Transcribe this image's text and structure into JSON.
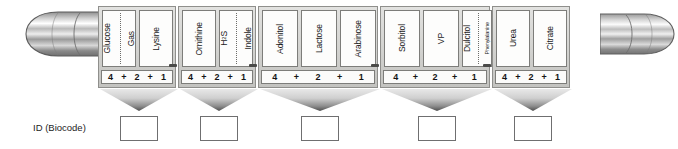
{
  "diagram": {
    "caption": "ID (Biocode)",
    "end_caps": {
      "left": "metallic-capsule-end",
      "right": "metallic-capsule-end"
    },
    "colors": {
      "tray_body": "#d2d2cf",
      "tray_border": "#8f8f8c",
      "cell_fill": "#fdfdfc",
      "cell_border": "#7d7d7a",
      "funnel_dark": "#4f4f4f",
      "funnel_light": "#e8e8e8",
      "text": "#1b1b1b",
      "result_box_border": "#6f6f70"
    },
    "groups": [
      {
        "id": "group-1",
        "left": 0,
        "width": 78,
        "score": [
          "4",
          "+",
          "2",
          "+",
          "1"
        ],
        "cells": [
          {
            "width": 34,
            "labels": [
              "Glucose",
              "Gas"
            ],
            "split": true,
            "divider_pct": 52
          },
          {
            "width": 34,
            "labels": [
              "Lysine"
            ],
            "split": false
          }
        ]
      },
      {
        "id": "group-2",
        "left": 80,
        "width": 78,
        "score": [
          "4",
          "+",
          "2",
          "+",
          "1"
        ],
        "cells": [
          {
            "width": 34,
            "labels": [
              "Ornithine"
            ],
            "split": false
          },
          {
            "width": 34,
            "labels": [
              "H2S",
              "Indole"
            ],
            "split": true,
            "divider_pct": 50
          }
        ]
      },
      {
        "id": "group-3",
        "left": 160,
        "width": 120,
        "score": [
          "4",
          "+",
          "2",
          "+",
          "1"
        ],
        "cells": [
          {
            "width": 36,
            "labels": [
              "Adonitol"
            ],
            "split": false
          },
          {
            "width": 36,
            "labels": [
              "Lactose"
            ],
            "split": false
          },
          {
            "width": 36,
            "labels": [
              "Arabinose"
            ],
            "split": false
          }
        ]
      },
      {
        "id": "group-4",
        "left": 282,
        "width": 110,
        "score": [
          "4",
          "+",
          "2",
          "+",
          "1"
        ],
        "cells": [
          {
            "width": 36,
            "labels": [
              "Sorbitol"
            ],
            "split": false
          },
          {
            "width": 36,
            "labels": [
              "VP"
            ],
            "split": false
          },
          {
            "width": 30,
            "labels": [
              "Dulcitol",
              "Phenylalanine"
            ],
            "split": true,
            "divider_pct": 54,
            "tiny_second": true
          }
        ]
      },
      {
        "id": "group-5",
        "left": 394,
        "width": 78,
        "score": [
          "4",
          "+",
          "2",
          "+",
          "1"
        ],
        "cells": [
          {
            "width": 34,
            "labels": [
              "Urea"
            ],
            "split": false
          },
          {
            "width": 34,
            "labels": [
              "Citrate"
            ],
            "split": false
          }
        ]
      }
    ],
    "funnels": [
      {
        "id": "funnel-1",
        "left": 100,
        "width": 78
      },
      {
        "id": "funnel-2",
        "left": 180,
        "width": 78
      },
      {
        "id": "funnel-3",
        "left": 260,
        "width": 120
      },
      {
        "id": "funnel-4",
        "left": 382,
        "width": 110
      },
      {
        "id": "funnel-5",
        "left": 494,
        "width": 78
      }
    ],
    "result_boxes": [
      {
        "id": "result-box-1",
        "left": 120,
        "value": ""
      },
      {
        "id": "result-box-2",
        "left": 200,
        "value": ""
      },
      {
        "id": "result-box-3",
        "left": 301,
        "value": ""
      },
      {
        "id": "result-box-4",
        "left": 418,
        "value": ""
      },
      {
        "id": "result-box-5",
        "left": 514,
        "value": ""
      }
    ]
  }
}
